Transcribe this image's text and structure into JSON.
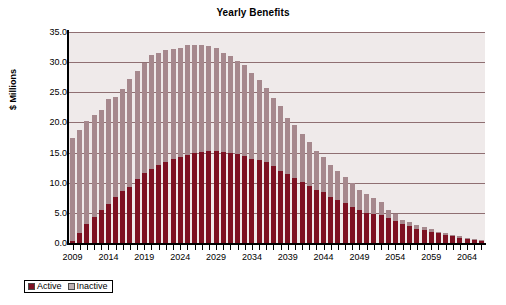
{
  "chart_data": {
    "type": "bar",
    "stacked": true,
    "title": "Yearly Benefits",
    "xlabel": "",
    "ylabel": "$ Millions",
    "ylim": [
      0,
      35
    ],
    "ytick_values": [
      0,
      5,
      10,
      15,
      20,
      25,
      30,
      35
    ],
    "ytick_labels": [
      "0.0",
      "5.0",
      "10.0",
      "15.0",
      "20.0",
      "25.0",
      "30.0",
      "35.0"
    ],
    "grid": true,
    "legend_position": "bottom-left",
    "legend": [
      "Active",
      "Inactive"
    ],
    "colors": {
      "active": "#7d1122",
      "inactive": "#a6888d",
      "legend_inactive_swatch": "#bdb0b2",
      "plot_background": "#efeaea",
      "gridline": "#8f6f72",
      "axis": "#000000"
    },
    "categories": [
      2009,
      2010,
      2011,
      2012,
      2013,
      2014,
      2015,
      2016,
      2017,
      2018,
      2019,
      2020,
      2021,
      2022,
      2023,
      2024,
      2025,
      2026,
      2027,
      2028,
      2029,
      2030,
      2031,
      2032,
      2033,
      2034,
      2035,
      2036,
      2037,
      2038,
      2039,
      2040,
      2041,
      2042,
      2043,
      2044,
      2045,
      2046,
      2047,
      2048,
      2049,
      2050,
      2051,
      2052,
      2053,
      2054,
      2055,
      2056,
      2057,
      2058,
      2059,
      2060,
      2061,
      2062,
      2063,
      2064,
      2065,
      2066
    ],
    "xtick_labels": [
      "2009",
      "2014",
      "2019",
      "2024",
      "2029",
      "2034",
      "2039",
      "2044",
      "2049",
      "2054",
      "2059",
      "2064"
    ],
    "xtick_label_years": [
      2009,
      2014,
      2019,
      2024,
      2029,
      2034,
      2039,
      2044,
      2049,
      2054,
      2059,
      2064
    ],
    "series": [
      {
        "name": "Active",
        "color": "#7d1122",
        "values": [
          0.3,
          1.7,
          3.1,
          4.3,
          5.4,
          6.5,
          7.7,
          8.7,
          9.3,
          10.6,
          11.6,
          12.2,
          13.0,
          13.4,
          14.0,
          14.3,
          14.6,
          15.0,
          15.1,
          15.2,
          15.2,
          15.1,
          14.9,
          14.8,
          14.5,
          14.0,
          13.8,
          13.5,
          12.8,
          12.0,
          11.5,
          10.8,
          10.2,
          9.5,
          8.8,
          8.4,
          7.7,
          7.1,
          6.6,
          6.0,
          5.4,
          4.9,
          4.8,
          4.6,
          4.2,
          3.6,
          3.1,
          2.8,
          2.4,
          2.1,
          1.9,
          1.6,
          1.3,
          1.1,
          0.9,
          0.7,
          0.5,
          0.4
        ]
      },
      {
        "name": "Inactive",
        "color": "#a6888d",
        "values": [
          17.2,
          17.0,
          17.2,
          17.0,
          16.6,
          17.4,
          16.5,
          16.8,
          17.9,
          18.0,
          18.3,
          19.0,
          18.6,
          18.6,
          18.2,
          18.0,
          18.3,
          17.9,
          17.8,
          17.4,
          17.1,
          16.5,
          16.1,
          15.4,
          15.0,
          14.2,
          13.3,
          12.2,
          11.3,
          10.8,
          9.3,
          8.7,
          7.9,
          7.2,
          6.4,
          5.8,
          5.2,
          4.8,
          4.4,
          3.9,
          3.4,
          3.3,
          2.6,
          2.2,
          1.3,
          1.2,
          0.8,
          0.7,
          0.6,
          0.5,
          0.4,
          0.3,
          0.3,
          0.2,
          0.2,
          0.2,
          0.1,
          0.1
        ]
      }
    ],
    "totals": [
      17.5,
      18.7,
      20.3,
      21.3,
      22.0,
      23.9,
      24.2,
      25.5,
      27.2,
      28.6,
      29.9,
      31.2,
      31.6,
      32.0,
      32.2,
      32.3,
      32.9,
      32.9,
      32.9,
      32.6,
      32.3,
      31.6,
      31.0,
      30.2,
      29.5,
      28.2,
      27.1,
      25.7,
      24.1,
      22.8,
      20.8,
      19.5,
      18.1,
      16.7,
      15.2,
      14.2,
      12.9,
      11.9,
      11.0,
      9.9,
      8.8,
      8.2,
      7.4,
      6.8,
      5.5,
      4.8,
      3.9,
      3.5,
      3.0,
      2.6,
      2.3,
      1.9,
      1.6,
      1.3,
      1.1,
      0.9,
      0.6,
      0.5
    ]
  }
}
